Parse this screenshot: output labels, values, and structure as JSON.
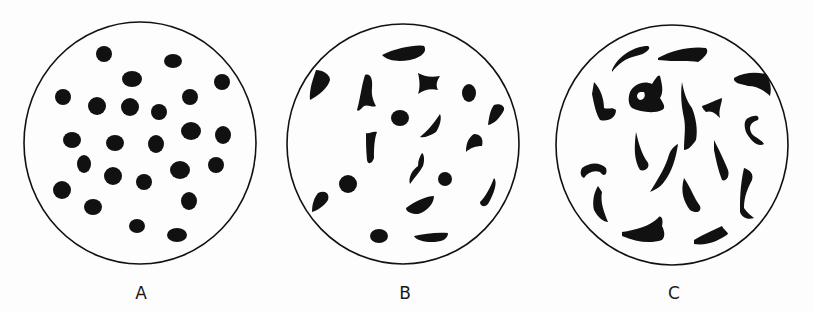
{
  "figure": {
    "background": "#fdfdfd",
    "ink": "#111111",
    "panels": [
      {
        "id": "A",
        "label": "A",
        "label_x": 141,
        "circle": {
          "cx": 140,
          "cy": 143,
          "rx": 116,
          "ry": 121
        },
        "description": "Round, regularly shaped particles",
        "dots": [
          [
            104,
            54,
            8,
            8
          ],
          [
            173,
            61,
            9,
            7
          ],
          [
            132,
            79,
            10,
            8
          ],
          [
            222,
            82,
            8,
            8
          ],
          [
            63,
            97,
            8,
            8
          ],
          [
            97,
            106,
            9,
            9
          ],
          [
            130,
            107,
            9,
            9
          ],
          [
            159,
            112,
            8,
            8
          ],
          [
            190,
            97,
            8,
            8
          ],
          [
            72,
            140,
            9,
            8
          ],
          [
            115,
            143,
            9,
            8
          ],
          [
            156,
            144,
            8,
            9
          ],
          [
            191,
            131,
            10,
            9
          ],
          [
            223,
            135,
            8,
            9
          ],
          [
            84,
            164,
            7,
            9
          ],
          [
            113,
            176,
            9,
            9
          ],
          [
            144,
            182,
            8,
            8
          ],
          [
            180,
            170,
            10,
            9
          ],
          [
            216,
            165,
            8,
            8
          ],
          [
            62,
            190,
            9,
            9
          ],
          [
            93,
            207,
            9,
            8
          ],
          [
            189,
            201,
            8,
            9
          ],
          [
            137,
            226,
            8,
            7
          ],
          [
            177,
            235,
            10,
            7
          ]
        ],
        "shapes": []
      },
      {
        "id": "B",
        "label": "B",
        "label_x": 405,
        "circle": {
          "cx": 403,
          "cy": 144,
          "rx": 116,
          "ry": 120
        },
        "description": "Mixture of round and irregular particles",
        "dots": [
          [
            469,
            93,
            7,
            9
          ],
          [
            400,
            118,
            9,
            8
          ],
          [
            348,
            184,
            9,
            9
          ],
          [
            445,
            179,
            7,
            7
          ],
          [
            379,
            236,
            9,
            7
          ]
        ],
        "shapes": [
          "M382,55 C395,48 418,44 424,46 C428,52 420,58 410,60 C398,62 388,61 382,55 Z",
          "M316,70 C322,70 330,74 330,80 C328,88 318,96 310,100 C309,92 312,82 314,76 Z",
          "M365,75 C370,73 373,78 372,88 C371,96 374,102 376,106 C372,108 368,104 364,106 C360,110 358,112 357,110 C360,100 361,88 365,75 Z",
          "M418,73 C424,76 430,78 440,76 C436,82 436,86 438,90 C430,88 424,90 418,94 C420,88 420,82 418,73 Z",
          "M494,105 C500,103 505,106 504,110 C500,118 494,124 488,125 C489,118 490,110 494,105 Z",
          "M440,114 C442,118 440,126 436,132 C430,136 424,138 420,137 C426,132 432,126 440,114 Z",
          "M474,134 C480,134 484,138 482,146 C476,146 470,148 466,152 C466,144 468,138 474,134 Z",
          "M366,133 C370,134 372,131 377,132 C374,140 374,150 374,158 C372,164 368,165 367,160 C366,150 366,142 366,133 Z",
          "M422,153 C424,154 425,160 423,166 C420,172 414,178 410,184 C408,178 412,170 418,166 C418,160 420,156 422,153 Z",
          "M494,178 C498,182 494,194 488,204 C484,208 480,206 480,202 C486,196 490,188 494,178 Z",
          "M318,193 C324,190 330,192 328,200 C324,206 318,210 312,212 C312,204 314,198 318,193 Z",
          "M406,208 C414,202 426,196 434,196 C434,204 426,212 418,214 C412,214 406,212 406,208 Z",
          "M414,236 C424,234 436,232 448,233 C448,240 440,242 432,242 C424,242 416,240 414,236 Z"
        ]
      },
      {
        "id": "C",
        "label": "C",
        "label_x": 674,
        "circle": {
          "cx": 672,
          "cy": 145,
          "rx": 116,
          "ry": 120
        },
        "description": "Highly irregular, elongated and curved particles",
        "dots": [],
        "shapes": [
          "M612,70 C618,56 634,46 648,46 C652,48 646,54 636,56 C626,58 618,64 612,72 Z",
          "M658,58 C672,50 692,46 706,48 C710,52 704,58 698,62 C690,60 676,62 658,60 Z",
          "M734,78 C744,72 756,72 766,74 C770,80 772,88 770,96 C764,90 756,86 748,86 C742,84 736,84 734,80 Z",
          "M594,82 C600,88 604,98 604,108 C608,110 612,106 616,110 C616,118 608,122 600,120 C596,114 594,104 592,94 Z",
          "M630,92 C634,84 644,80 652,84 C656,78 658,74 660,76 C662,84 664,92 660,98 C664,104 666,108 662,110 C654,114 640,112 632,108 C628,104 628,98 630,92 Z M640,92 C636,94 636,98 640,100 C644,100 646,96 644,92 Z",
          "M682,82 C684,92 686,100 692,108 C696,118 698,130 696,140 C692,146 688,150 684,150 C684,138 686,128 684,118 C682,108 680,96 682,82 Z",
          "M702,106 C708,104 716,100 722,98 C722,104 718,110 720,118 C716,114 712,110 706,112 C704,110 702,108 702,106 Z",
          "M748,118 C756,114 760,116 758,120 C750,122 748,128 752,134 C756,138 762,140 764,144 C758,148 750,140 746,132 C744,126 744,120 748,118 Z",
          "M636,132 C638,140 640,150 646,160 C652,166 646,172 640,170 C634,160 634,148 636,132 Z",
          "M714,140 C718,148 724,160 728,170 C730,176 726,182 722,180 C718,170 716,160 714,150 Z",
          "M582,168 C590,162 600,162 606,168 C608,174 604,178 600,172 C594,170 588,172 584,178 C580,176 580,172 582,168 Z",
          "M678,144 C676,158 672,172 664,182 C660,188 654,190 650,192 C656,182 664,170 668,158 C670,150 674,146 678,144 Z",
          "M744,168 C750,170 754,174 752,180 C748,188 744,196 744,208 C748,214 752,216 754,218 C748,220 742,218 740,212 C740,200 740,186 744,168 Z",
          "M684,178 C690,186 694,198 700,206 C702,212 696,214 690,210 C684,202 680,192 684,178 Z",
          "M598,186 C594,192 592,202 594,210 C598,218 604,222 608,222 C604,212 600,202 602,192 Z",
          "M622,232 C636,230 650,226 658,218 C660,214 664,218 662,226 C664,230 666,236 662,240 C650,244 636,242 622,236 Z",
          "M694,240 C704,234 714,230 722,226 C724,230 728,232 728,234 C720,240 708,246 694,244 Z"
        ]
      }
    ]
  }
}
